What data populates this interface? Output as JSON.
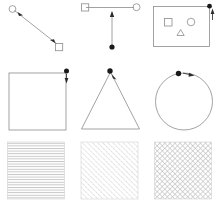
{
  "figure": {
    "background_color": "#ffffff",
    "width": 221,
    "height": 211,
    "rows": 3,
    "columns": 3,
    "shape_stroke_color": "#8c8c8c",
    "handle_color": "#1a1a1a",
    "arrow_color": "#2b2b2b",
    "hatch_color": "#c9c9c9"
  },
  "panels": [
    {
      "id": "panel-a",
      "row": 1,
      "column": 1,
      "name": "line-with-circle-and-square-endpoints",
      "description": "Diagonal connector line from an open circle node at upper-left to an open square node at lower-right, with arrow markers along the line",
      "elements": [
        "circle-node",
        "square-node",
        "connector-line",
        "arrow-head"
      ]
    },
    {
      "id": "panel-b",
      "row": 1,
      "column": 2,
      "name": "square-circle-horizontal-connector",
      "description": "Open square at left and open circle at right joined by a horizontal line; a vertical line drops from the midpoint with an up arrow and a filled dot at its lower end",
      "elements": [
        "square-node",
        "circle-node",
        "horizontal-line",
        "vertical-line",
        "up-arrow-head",
        "filled-dot"
      ]
    },
    {
      "id": "panel-c",
      "row": 1,
      "column": 3,
      "name": "rectangle-container-with-inner-shapes",
      "description": "Rectangle frame containing an open square, an open circle and an open triangle; a filled dot sits at the upper-right corner with an upward arrow",
      "elements": [
        "rectangle-frame",
        "inner-square",
        "inner-circle",
        "inner-triangle",
        "corner-dot",
        "up-arrow-head"
      ]
    },
    {
      "id": "panel-d",
      "row": 2,
      "column": 1,
      "name": "square-with-corner-handle",
      "description": "Large open square with a filled drag handle dot at the top-right corner and a short downward arrow",
      "elements": [
        "square-outline",
        "corner-handle-dot",
        "down-arrow-head"
      ]
    },
    {
      "id": "panel-e",
      "row": 2,
      "column": 2,
      "name": "triangle-with-apex-handle",
      "description": "Large open triangle with a filled drag handle dot at the apex and a short arrow",
      "elements": [
        "triangle-outline",
        "apex-handle-dot",
        "arrow-head"
      ]
    },
    {
      "id": "panel-f",
      "row": 2,
      "column": 3,
      "name": "circle-with-top-handle",
      "description": "Large open circle with a filled drag handle dot at the top and a short arrow pointing right along the arc",
      "elements": [
        "circle-outline",
        "top-handle-dot",
        "arc-arrow-head"
      ]
    },
    {
      "id": "panel-g",
      "row": 3,
      "column": 1,
      "name": "horizontal-hatch-fill",
      "description": "Square region filled with evenly spaced horizontal hatch lines",
      "pattern": "horizontal-lines",
      "line_spacing_px": 2.6,
      "line_angle_degrees": 0
    },
    {
      "id": "panel-h",
      "row": 3,
      "column": 2,
      "name": "diagonal-hatch-fill",
      "description": "Square region filled with evenly spaced diagonal hatch lines running from lower-left to upper-right",
      "pattern": "diagonal-lines",
      "line_spacing_px": 2.6,
      "line_angle_degrees": 45
    },
    {
      "id": "panel-i",
      "row": 3,
      "column": 3,
      "name": "cross-hatch-fill",
      "description": "Square region filled with a cross-hatch grid of lines in both diagonal directions producing a checkerboard texture",
      "pattern": "cross-hatch",
      "line_spacing_px": 2.6,
      "line_angle_degrees": 45
    }
  ]
}
